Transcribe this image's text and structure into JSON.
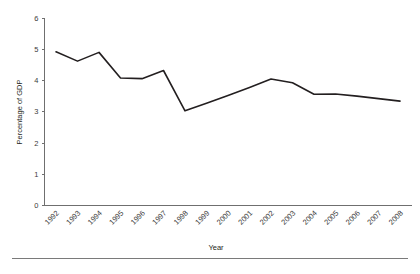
{
  "chart_data": {
    "type": "line",
    "title": "",
    "subtitle": "",
    "xlabel": "Year",
    "ylabel": "Percentage of GDP",
    "categories": [
      "1992",
      "1993",
      "1994",
      "1995",
      "1996",
      "1997",
      "1998",
      "1999",
      "2000",
      "2001",
      "2002",
      "2003",
      "2004",
      "2005",
      "2006",
      "2007",
      "2008"
    ],
    "values": [
      4.92,
      4.62,
      4.9,
      4.08,
      4.06,
      4.32,
      3.03,
      3.27,
      3.52,
      3.78,
      4.05,
      3.93,
      3.56,
      3.57,
      3.5,
      3.42,
      3.34
    ],
    "series": [
      {
        "name": "Percentage of GDP",
        "values": [
          4.92,
          4.62,
          4.9,
          4.08,
          4.06,
          4.32,
          3.03,
          3.27,
          3.52,
          3.78,
          4.05,
          3.93,
          3.56,
          3.57,
          3.5,
          3.42,
          3.34
        ]
      }
    ],
    "ylim": [
      0,
      6
    ],
    "yticks": [
      0,
      1,
      2,
      3,
      4,
      5,
      6
    ],
    "ytick_labels": [
      "0",
      "1",
      "2",
      "3",
      "4",
      "5",
      "6"
    ],
    "grid": false,
    "legend": false,
    "legend_position": "none",
    "line_color": "#231f20",
    "axis_color": "#6f6f6f",
    "xtick_rotation": 45
  },
  "axes": {
    "y_title": "Percentage of GDP",
    "x_title": "Year"
  }
}
